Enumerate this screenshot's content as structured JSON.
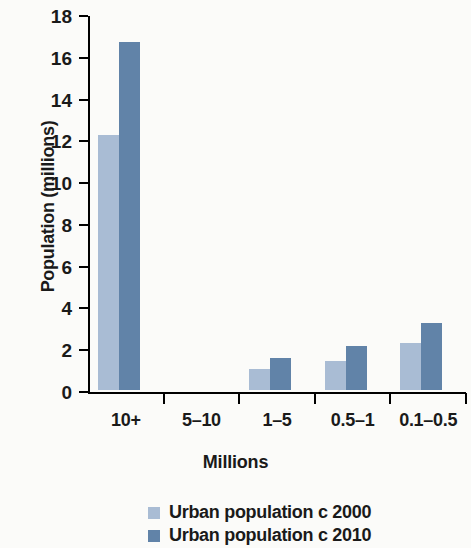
{
  "chart_data": {
    "type": "bar",
    "title": "",
    "xlabel": "Millions",
    "ylabel": "Population (millions)",
    "categories": [
      "10+",
      "5–10",
      "1–5",
      "0.5–1",
      "0.1–0.5"
    ],
    "series": [
      {
        "name": "Urban population c 2000",
        "color": "#a9bcd4",
        "values": [
          12.2,
          0,
          1.0,
          1.4,
          2.25
        ]
      },
      {
        "name": "Urban population c 2010",
        "color": "#6183a8",
        "values": [
          16.65,
          0,
          1.55,
          2.1,
          3.2
        ]
      }
    ],
    "ylim": [
      0,
      18
    ],
    "ytick_values": [
      0,
      2,
      4,
      6,
      8,
      10,
      12,
      14,
      16,
      18
    ],
    "ytick_labels": [
      "0",
      "2",
      "4",
      "6",
      "8",
      "10",
      "12",
      "14",
      "16",
      "18"
    ],
    "grid": false,
    "legend_position": "bottom-center"
  },
  "legend": {
    "items": [
      {
        "label": "Urban population c 2000",
        "color": "#a9bcd4"
      },
      {
        "label": "Urban population c 2010",
        "color": "#6183a8"
      }
    ]
  }
}
